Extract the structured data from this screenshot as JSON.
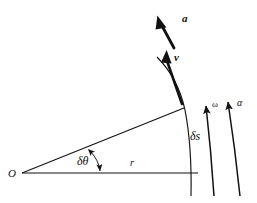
{
  "figure": {
    "background_color": "#ffffff",
    "stroke_color": "#111111",
    "labels": {
      "origin": "O",
      "radius": "r",
      "angular_displacement": "δθ",
      "arc_length": "δs",
      "velocity": "v",
      "acceleration": "a",
      "angular_velocity": "ω",
      "angular_acceleration": "α"
    },
    "elements": [
      {
        "name": "baseline-radius",
        "type": "line",
        "label": "r"
      },
      {
        "name": "upper-radius",
        "type": "line",
        "label": ""
      },
      {
        "name": "circular-arc",
        "type": "arc",
        "label": "δs"
      },
      {
        "name": "angle-arc-marker",
        "type": "arc-double-arrow",
        "label": "δθ"
      },
      {
        "name": "velocity-vector",
        "type": "bold-arrow",
        "label": "v"
      },
      {
        "name": "acceleration-vector",
        "type": "bold-arrow",
        "label": "a"
      },
      {
        "name": "angular-velocity-arrow",
        "type": "curved-arrow",
        "label": "ω"
      },
      {
        "name": "angular-acceleration-arrow",
        "type": "curved-arrow",
        "label": "α"
      }
    ]
  }
}
